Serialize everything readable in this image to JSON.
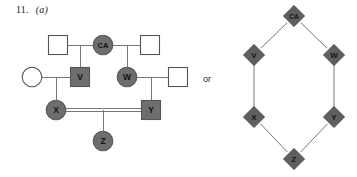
{
  "figure": {
    "number": "11.",
    "part": "(a)",
    "connector_text": "or",
    "colors": {
      "affected_fill": "#6e6e6e",
      "unaffected_fill": "#ffffff",
      "stroke": "#555555",
      "line": "#777777",
      "diamond_fill": "#5f5f63",
      "diamond_stroke": "#4a4a4e",
      "text": "#1a1a1a"
    }
  },
  "pedigree": {
    "title": "pedigree-chart",
    "individuals": [
      {
        "id": "i1",
        "label": "",
        "shape": "square",
        "status": "unaffected",
        "generation": 1,
        "cx": 58,
        "cy": 45
      },
      {
        "id": "ca",
        "label": "CA",
        "shape": "circle",
        "status": "affected",
        "generation": 1,
        "cx": 103,
        "cy": 45
      },
      {
        "id": "i3",
        "label": "",
        "shape": "square",
        "status": "unaffected",
        "generation": 1,
        "cx": 150,
        "cy": 45
      },
      {
        "id": "i4",
        "label": "",
        "shape": "circle",
        "status": "unaffected",
        "generation": 2,
        "cx": 32,
        "cy": 77
      },
      {
        "id": "v",
        "label": "V",
        "shape": "square",
        "status": "affected",
        "generation": 2,
        "cx": 80,
        "cy": 77
      },
      {
        "id": "w",
        "label": "W",
        "shape": "circle",
        "status": "affected",
        "generation": 2,
        "cx": 127,
        "cy": 77
      },
      {
        "id": "i7",
        "label": "",
        "shape": "square",
        "status": "unaffected",
        "generation": 2,
        "cx": 178,
        "cy": 77
      },
      {
        "id": "x",
        "label": "X",
        "shape": "circle",
        "status": "affected",
        "generation": 3,
        "cx": 56,
        "cy": 110
      },
      {
        "id": "y",
        "label": "Y",
        "shape": "square",
        "status": "affected",
        "generation": 3,
        "cx": 151,
        "cy": 110
      },
      {
        "id": "z",
        "label": "Z",
        "shape": "circle",
        "status": "affected",
        "generation": 4,
        "cx": 103,
        "cy": 141
      }
    ],
    "matings": [
      {
        "between": [
          "i1",
          "ca"
        ],
        "type": "single"
      },
      {
        "between": [
          "ca",
          "i3"
        ],
        "type": "single"
      },
      {
        "between": [
          "i4",
          "v"
        ],
        "type": "single"
      },
      {
        "between": [
          "w",
          "i7"
        ],
        "type": "single"
      },
      {
        "between": [
          "x",
          "y"
        ],
        "type": "consanguineous-double-line"
      }
    ],
    "offspring": [
      {
        "parents": [
          "i1",
          "ca"
        ],
        "child": "v"
      },
      {
        "parents": [
          "ca",
          "i3"
        ],
        "child": "w"
      },
      {
        "parents": [
          "i4",
          "v"
        ],
        "child": "x"
      },
      {
        "parents": [
          "w",
          "i7"
        ],
        "child": "y"
      },
      {
        "parents": [
          "x",
          "y"
        ],
        "child": "z"
      }
    ]
  },
  "graph": {
    "title": "transmission-diamond-graph",
    "nodes": [
      {
        "id": "ca",
        "label": "CA",
        "cx": 294,
        "cy": 16
      },
      {
        "id": "v",
        "label": "V",
        "cx": 254,
        "cy": 55
      },
      {
        "id": "w",
        "label": "W",
        "cx": 334,
        "cy": 55
      },
      {
        "id": "x",
        "label": "X",
        "cx": 254,
        "cy": 117
      },
      {
        "id": "y",
        "label": "Y",
        "cx": 334,
        "cy": 117
      },
      {
        "id": "z",
        "label": "Z",
        "cx": 294,
        "cy": 159
      }
    ],
    "edges": [
      {
        "from": "ca",
        "to": "v"
      },
      {
        "from": "ca",
        "to": "w"
      },
      {
        "from": "v",
        "to": "x"
      },
      {
        "from": "w",
        "to": "y"
      },
      {
        "from": "x",
        "to": "z"
      },
      {
        "from": "y",
        "to": "z"
      }
    ]
  }
}
